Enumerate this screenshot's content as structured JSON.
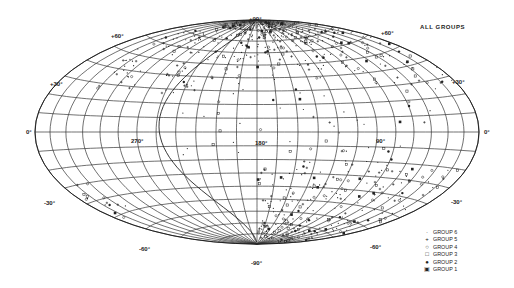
{
  "map": {
    "title": "ALL GROUPS",
    "projection": "aitoff-hammer",
    "center": {
      "cx": 257,
      "cy": 132
    },
    "semi_axes": {
      "rx": 222,
      "ry": 112
    },
    "latitude_labels": [
      {
        "text": "+90°",
        "lat": 90,
        "x": 249,
        "y": 21
      },
      {
        "text": "+60°",
        "x": 111,
        "y": 38
      },
      {
        "text": "+60°",
        "x": 381,
        "y": 35
      },
      {
        "text": "+30°",
        "x": 50,
        "y": 86
      },
      {
        "text": "+30°",
        "x": 452,
        "y": 84
      },
      {
        "text": "0°",
        "x": 26,
        "y": 134
      },
      {
        "text": "0°",
        "x": 484,
        "y": 134
      },
      {
        "text": "-30°",
        "x": 44,
        "y": 205
      },
      {
        "text": "-30°",
        "x": 451,
        "y": 204
      },
      {
        "text": "-60°",
        "x": 139,
        "y": 251
      },
      {
        "text": "-60°",
        "x": 370,
        "y": 249
      },
      {
        "text": "-90°",
        "x": 251,
        "y": 265
      }
    ],
    "longitude_labels": [
      {
        "text": "270°",
        "x": 131,
        "y": 143
      },
      {
        "text": "180°",
        "x": 255,
        "y": 145
      },
      {
        "text": "90°",
        "x": 376,
        "y": 143
      }
    ]
  },
  "legend": {
    "items": [
      {
        "symbol": "·",
        "label": "GROUP 6"
      },
      {
        "symbol": "+",
        "label": "GROUP 5"
      },
      {
        "symbol": "○",
        "label": "GROUP 4"
      },
      {
        "symbol": "□",
        "label": "GROUP 3"
      },
      {
        "symbol": "●",
        "label": "GROUP 2"
      },
      {
        "symbol": "▣",
        "label": "GROUP 1"
      }
    ]
  }
}
